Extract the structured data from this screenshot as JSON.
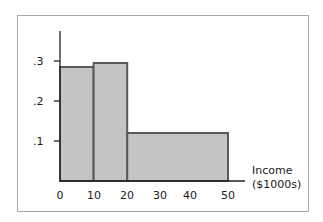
{
  "chart_data": {
    "type": "bar",
    "subtype": "histogram",
    "title": "",
    "xlabel": "Income ($1000s)",
    "xlabel_lines": [
      "Income",
      "($1000s)"
    ],
    "ylabel": "",
    "bins": [
      {
        "from": 0,
        "to": 10,
        "value": 0.285
      },
      {
        "from": 10,
        "to": 20,
        "value": 0.295
      },
      {
        "from": 20,
        "to": 50,
        "value": 0.12
      }
    ],
    "categories": [
      "0-10",
      "10-20",
      "20-50"
    ],
    "values": [
      0.285,
      0.295,
      0.12
    ],
    "x_ticks": [
      "0",
      "10",
      "20",
      "30",
      "40",
      "50"
    ],
    "y_ticks": [
      ".1",
      ".2",
      ".3"
    ],
    "xlim": [
      0,
      55
    ],
    "ylim": [
      0,
      0.35
    ],
    "grid": false,
    "legend": null,
    "colors": {
      "bar_fill": "#c4c4c4",
      "bar_edge": "#5a5a5a",
      "axis": "#222222",
      "frame": "#a8a8a8"
    }
  }
}
